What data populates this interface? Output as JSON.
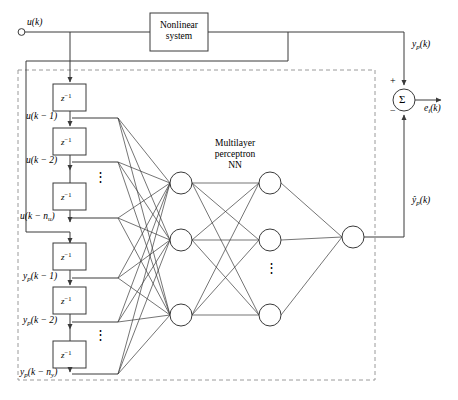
{
  "diagram": {
    "input": {
      "terminal_label": "u(k)",
      "terminal_name": "input-terminal"
    },
    "plant": {
      "label_line1": "Nonlinear",
      "label_line2": "system",
      "output_label": "y",
      "output_sub": "p",
      "output_rest": "(k)"
    },
    "nn": {
      "label_line1": "Multilayer",
      "label_line2": "perceptron",
      "label_line3": "NN",
      "output_label": "ŷ",
      "output_sub": "p",
      "output_rest": "(k)",
      "hidden1_count": 3,
      "hidden2_count": 3,
      "output_count": 1,
      "vertical_dots": "⋮"
    },
    "summing": {
      "symbol": "Σ",
      "plus": "+",
      "minus": "−",
      "error_label": "e",
      "error_sub": "i",
      "error_rest": "(k)"
    },
    "delays": {
      "block_symbol": "z",
      "block_exp": "−1",
      "vertical_dots": "⋮",
      "u_taps": [
        {
          "base": "u",
          "sub": "",
          "arg": "(k − 1)",
          "name": "tap-u-k-1"
        },
        {
          "base": "u",
          "sub": "",
          "arg": "(k − 2)",
          "name": "tap-u-k-2"
        },
        {
          "base": "u",
          "sub": "",
          "arg": "(k − n",
          "arg_sub": "u",
          "arg_end": ")",
          "name": "tap-u-k-nu"
        }
      ],
      "y_taps": [
        {
          "base": "y",
          "sub": "p",
          "arg": "(k − 1)",
          "name": "tap-yp-k-1"
        },
        {
          "base": "y",
          "sub": "p",
          "arg": "(k − 2)",
          "name": "tap-yp-k-2"
        },
        {
          "base": "y",
          "sub": "p",
          "arg": "(k − n",
          "arg_sub": "y",
          "arg_end": ")",
          "name": "tap-yp-k-ny"
        }
      ],
      "count_u": 4,
      "count_y": 3
    },
    "colors": {
      "line": "#3a3a3a",
      "dashed": "#9a9a9a",
      "text": "#000000",
      "background": "#ffffff"
    }
  }
}
